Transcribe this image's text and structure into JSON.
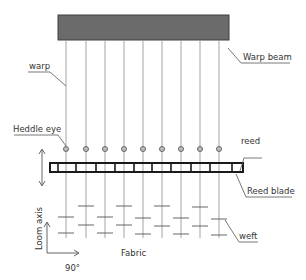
{
  "diagram": {
    "labels": {
      "warp_beam": "Warp beam",
      "warp": "warp",
      "heddle_eye": "Heddle eye",
      "reed": "reed",
      "reed_blade": "Reed blade",
      "weft": "weft",
      "loom_axis": "Loom axis",
      "fabric": "Fabric",
      "angle": "90°"
    },
    "colors": {
      "beam_fill": "#6b6b6b",
      "beam_border": "#3f3f3f",
      "reed_border": "#1a1a1a",
      "warp_line": "#9a9a9a"
    },
    "warp_count": 9
  }
}
